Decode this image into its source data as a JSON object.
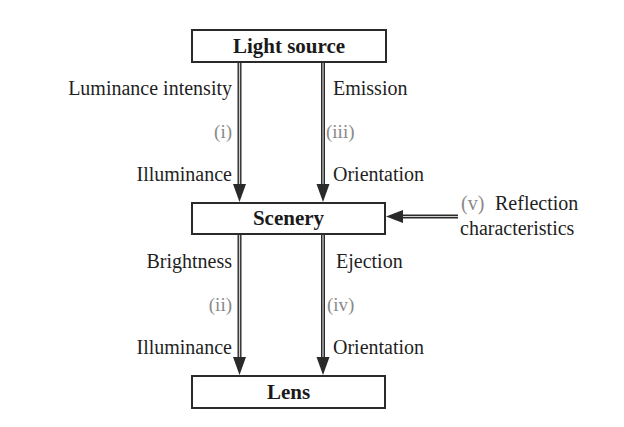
{
  "diagram": {
    "nodes": {
      "light_source": "Light source",
      "scenery": "Scenery",
      "lens": "Lens"
    },
    "upper_left": {
      "top_label": "Luminance intensity",
      "index": "(i)",
      "bottom_label": "Illuminance"
    },
    "upper_right": {
      "top_label": "Emission",
      "index": "(iii)",
      "bottom_label": "Orientation"
    },
    "lower_left": {
      "top_label": "Brightness",
      "index": "(ii)",
      "bottom_label": "Illuminance"
    },
    "lower_right": {
      "top_label": "Ejection",
      "index": "(iv)",
      "bottom_label": "Orientation"
    },
    "side_input": {
      "index": "(v)",
      "line1": "Reflection",
      "line2": "characteristics"
    },
    "edges": [
      {
        "from": "Light source",
        "to": "Scenery",
        "index": "(i)",
        "labels": [
          "Luminance intensity",
          "Illuminance"
        ]
      },
      {
        "from": "Light source",
        "to": "Scenery",
        "index": "(iii)",
        "labels": [
          "Emission",
          "Orientation"
        ]
      },
      {
        "from": "Scenery",
        "to": "Lens",
        "index": "(ii)",
        "labels": [
          "Brightness",
          "Illuminance"
        ]
      },
      {
        "from": "Scenery",
        "to": "Lens",
        "index": "(iv)",
        "labels": [
          "Ejection",
          "Orientation"
        ]
      },
      {
        "from": "Reflection characteristics",
        "to": "Scenery",
        "index": "(v)",
        "labels": [
          "Reflection characteristics"
        ]
      }
    ],
    "colors": {
      "stroke": "#2a2a2a",
      "text": "#1f1f1f",
      "index_text": "#8a8a8a"
    }
  }
}
